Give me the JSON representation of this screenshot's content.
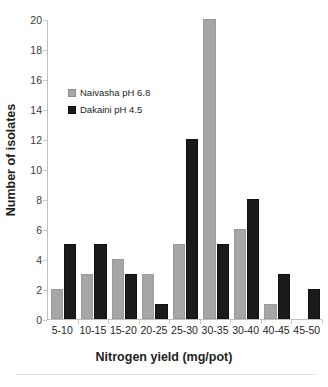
{
  "chart_data": {
    "type": "bar",
    "title": "",
    "xlabel": "Nitrogen yield (mg/pot)",
    "ylabel": "Number of isolates",
    "categories": [
      "5-10",
      "10-15",
      "15-20",
      "20-25",
      "25-30",
      "30-35",
      "30-40",
      "40-45",
      "45-50"
    ],
    "series": [
      {
        "name": "Naivasha pH 6.8",
        "color": "#a6a6a6",
        "values": [
          2,
          3,
          4,
          3,
          5,
          20,
          6,
          1,
          0
        ]
      },
      {
        "name": "Dakaini pH 4.5",
        "color": "#1b1b1b",
        "values": [
          5,
          5,
          3,
          1,
          12,
          5,
          8,
          3,
          2
        ]
      }
    ],
    "ylim": [
      0,
      20
    ],
    "yticks": [
      0,
      2,
      4,
      6,
      8,
      10,
      12,
      14,
      16,
      18,
      20
    ],
    "grid": false,
    "legend_position": "upper-left-inside"
  },
  "axes": {
    "y_title": "Number of isolates",
    "x_title": "Nitrogen yield (mg/pot)"
  },
  "legend": {
    "items": [
      {
        "label": "Naivasha pH 6.8",
        "swatch": "legend-swatch-gray"
      },
      {
        "label": "Dakaini pH 4.5",
        "swatch": "legend-swatch-black"
      }
    ]
  }
}
